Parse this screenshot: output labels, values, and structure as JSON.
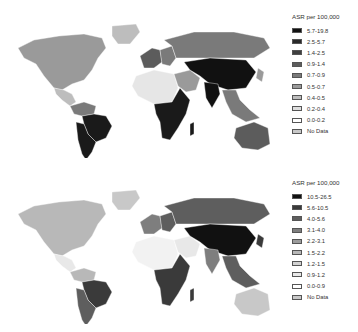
{
  "maps": [
    {
      "id": "top",
      "legend": {
        "title": "ASR per 100,000",
        "items": [
          {
            "label": "5.7-19.8",
            "color": "#111111"
          },
          {
            "label": "2.5-5.7",
            "color": "#2a2a2a"
          },
          {
            "label": "1.4-2.5",
            "color": "#3f3f3f"
          },
          {
            "label": "0.9-1.4",
            "color": "#5c5c5c"
          },
          {
            "label": "0.7-0.9",
            "color": "#7a7a7a"
          },
          {
            "label": "0.5-0.7",
            "color": "#9a9a9a"
          },
          {
            "label": "0.4-0.5",
            "color": "#bdbdbd"
          },
          {
            "label": "0.2-0.4",
            "color": "#dedede"
          },
          {
            "label": "0.0-0.2",
            "color": "#ffffff"
          },
          {
            "label": "No Data",
            "color": "#c8c8c8"
          }
        ]
      }
    },
    {
      "id": "bottom",
      "legend": {
        "title": "ASR per 100,000",
        "items": [
          {
            "label": "10.5-26.5",
            "color": "#111111"
          },
          {
            "label": "5.6-10.5",
            "color": "#3a3a3a"
          },
          {
            "label": "4.0-5.6",
            "color": "#5e5e5e"
          },
          {
            "label": "3.1-4.0",
            "color": "#7e7e7e"
          },
          {
            "label": "2.2-3.1",
            "color": "#9c9c9c"
          },
          {
            "label": "1.5-2.2",
            "color": "#b8b8b8"
          },
          {
            "label": "1.2-1.5",
            "color": "#d2d2d2"
          },
          {
            "label": "0.9-1.2",
            "color": "#e8e8e8"
          },
          {
            "label": "0.0-0.9",
            "color": "#ffffff"
          },
          {
            "label": "No Data",
            "color": "#c8c8c8"
          }
        ]
      }
    }
  ],
  "region_fills": {
    "top": {
      "north_america": "#9a9a9a",
      "greenland": "#bdbdbd",
      "central_america": "#bdbdbd",
      "south_america_north": "#7a7a7a",
      "brazil": "#1a1a1a",
      "south_america_south": "#1a1a1a",
      "europe_west": "#5c5c5c",
      "europe_east": "#7a7a7a",
      "russia": "#7a7a7a",
      "north_africa": "#e6e6e6",
      "sub_saharan_africa": "#1a1a1a",
      "middle_east": "#9a9a9a",
      "central_asia_china": "#111111",
      "india": "#111111",
      "southeast_asia": "#7a7a7a",
      "japan": "#9a9a9a",
      "australia": "#5c5c5c",
      "madagascar": "#1a1a1a"
    },
    "bottom": {
      "north_america": "#b8b8b8",
      "greenland": "#c8c8c8",
      "central_america": "#e8e8e8",
      "south_america_north": "#b8b8b8",
      "brazil": "#3a3a3a",
      "south_america_south": "#5e5e5e",
      "europe_west": "#7e7e7e",
      "europe_east": "#5e5e5e",
      "russia": "#5e5e5e",
      "north_africa": "#f2f2f2",
      "sub_saharan_africa": "#3a3a3a",
      "middle_east": "#e8e8e8",
      "central_asia_china": "#111111",
      "india": "#7e7e7e",
      "southeast_asia": "#5e5e5e",
      "japan": "#3a3a3a",
      "australia": "#c8c8c8",
      "madagascar": "#3a3a3a"
    }
  }
}
